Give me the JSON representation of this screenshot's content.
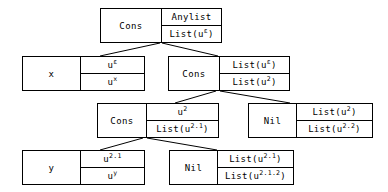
{
  "diagram": {
    "kind": "tree",
    "stroke_color": "#000000",
    "background_color": "#ffffff",
    "nodes": [
      {
        "id": "n1",
        "name": "root-cons",
        "constructor": "Cons",
        "top": "Anylist",
        "bottom_prefix": "List(u",
        "bottom_sup": "ε",
        "bottom_suffix": ")",
        "x": 100,
        "y": 8,
        "w": 122,
        "h": 35,
        "left_w": 60
      },
      {
        "id": "n2",
        "name": "var-x",
        "constructor": "x",
        "top_prefix": "u",
        "top_sup": "ε",
        "top_suffix": "",
        "bottom_prefix": "u",
        "bottom_sup": "x",
        "bottom_suffix": "",
        "x": 22,
        "y": 56,
        "w": 123,
        "h": 35,
        "left_w": 57
      },
      {
        "id": "n3",
        "name": "second-cons",
        "constructor": "Cons",
        "top_prefix": "List(u",
        "top_sup": "ε",
        "top_suffix": ")",
        "bottom_prefix": "List(u",
        "bottom_sup": "2",
        "bottom_suffix": ")",
        "x": 168,
        "y": 56,
        "w": 122,
        "h": 35,
        "left_w": 50
      },
      {
        "id": "n4",
        "name": "third-cons",
        "constructor": "Cons",
        "top_prefix": "u",
        "top_sup": "2",
        "top_suffix": "",
        "bottom_prefix": "List(u",
        "bottom_sup": "2.1",
        "bottom_suffix": ")",
        "x": 97,
        "y": 103,
        "w": 122,
        "h": 35,
        "left_w": 48
      },
      {
        "id": "n5",
        "name": "nil-right",
        "constructor": "Nil",
        "top_prefix": "List(u",
        "top_sup": "2",
        "top_suffix": ")",
        "bottom_prefix": "List(u",
        "bottom_sup": "2.2",
        "bottom_suffix": ")",
        "x": 248,
        "y": 103,
        "w": 125,
        "h": 35,
        "left_w": 47
      },
      {
        "id": "n6",
        "name": "var-y",
        "constructor": "y",
        "top_prefix": "u",
        "top_sup": "2.1",
        "top_suffix": "",
        "bottom_prefix": "u",
        "bottom_sup": "y",
        "bottom_suffix": "",
        "x": 22,
        "y": 150,
        "w": 123,
        "h": 35,
        "left_w": 57
      },
      {
        "id": "n7",
        "name": "nil-bottom",
        "constructor": "Nil",
        "top_prefix": "List(u",
        "top_sup": "2.1",
        "top_suffix": ")",
        "bottom_prefix": "List(u",
        "bottom_sup": "2.1.2",
        "bottom_suffix": ")",
        "x": 169,
        "y": 150,
        "w": 125,
        "h": 35,
        "left_w": 47
      }
    ],
    "edges": [
      {
        "name": "edge-root-to-x",
        "x1": 160,
        "y1": 43,
        "x2": 100,
        "y2": 56
      },
      {
        "name": "edge-root-to-cons2",
        "x1": 162,
        "y1": 43,
        "x2": 218,
        "y2": 56
      },
      {
        "name": "edge-cons2-to-cons3",
        "x1": 216,
        "y1": 91,
        "x2": 175,
        "y2": 103
      },
      {
        "name": "edge-cons2-to-nil",
        "x1": 220,
        "y1": 91,
        "x2": 290,
        "y2": 103
      },
      {
        "name": "edge-cons3-to-y",
        "x1": 143,
        "y1": 138,
        "x2": 100,
        "y2": 150
      },
      {
        "name": "edge-cons3-to-nil2",
        "x1": 147,
        "y1": 138,
        "x2": 217,
        "y2": 150
      }
    ]
  }
}
